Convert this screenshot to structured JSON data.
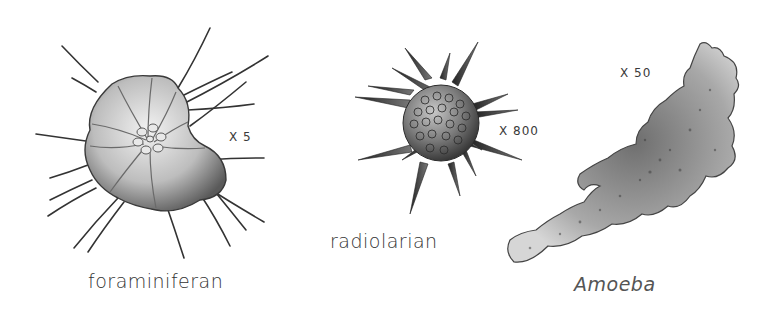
{
  "specimens": [
    {
      "name": "foraminiferan",
      "magnification": "X 5",
      "italic": false
    },
    {
      "name": "radiolarian",
      "magnification": "X 800",
      "italic": false
    },
    {
      "name": "Amoeba",
      "magnification": "X 50",
      "italic": true
    }
  ],
  "colors": {
    "background": "#ffffff",
    "ink": "#2a2a2a",
    "shell_light": "#d8d8d8",
    "shell_dark": "#555555",
    "amoeba_fill": "#b8b8b8"
  }
}
